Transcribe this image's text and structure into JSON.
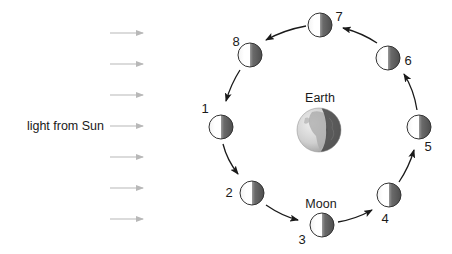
{
  "diagram": {
    "light_label": "light from Sun",
    "earth_label": "Earth",
    "moon_label": "Moon",
    "colors": {
      "light_arrow": "#b8b8b8",
      "orbit_arrow": "#1a1a1a",
      "moon_lit": "#ffffff",
      "moon_dark": "#555555",
      "moon_outline": "#333333",
      "text": "#1a1a1a"
    },
    "light_arrows_y": [
      33,
      64,
      95,
      126,
      157,
      188,
      219
    ],
    "earth": {
      "cx": 319,
      "cy": 130,
      "r": 22
    },
    "moons": [
      {
        "label": "1",
        "cx": 221,
        "cy": 127,
        "label_x": 205,
        "label_y": 108
      },
      {
        "label": "2",
        "cx": 252,
        "cy": 193,
        "label_x": 229,
        "label_y": 192
      },
      {
        "label": "3",
        "cx": 322,
        "cy": 225,
        "label_x": 302,
        "label_y": 239
      },
      {
        "label": "4",
        "cx": 389,
        "cy": 195,
        "label_x": 385,
        "label_y": 218
      },
      {
        "label": "5",
        "cx": 419,
        "cy": 127,
        "label_x": 428,
        "label_y": 146
      },
      {
        "label": "6",
        "cx": 388,
        "cy": 58,
        "label_x": 408,
        "label_y": 60
      },
      {
        "label": "7",
        "cx": 320,
        "cy": 25,
        "label_x": 339,
        "label_y": 16
      },
      {
        "label": "8",
        "cx": 250,
        "cy": 55,
        "label_x": 236,
        "label_y": 41
      }
    ]
  }
}
